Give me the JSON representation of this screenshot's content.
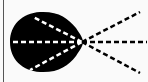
{
  "diagram": {
    "background": "#fafafa",
    "border_color": "#555555",
    "blob": {
      "fill": "#000000",
      "path": "M 40 12 C 58 11, 68 18, 76 28 C 80 34, 83 38, 83 42 C 83 46, 80 50, 76 56 C 68 66, 58 73, 40 72 C 22 71, 10 59, 10 42 C 10 25, 22 13, 40 12 Z"
    },
    "origin": {
      "x": 82,
      "y": 42
    },
    "rays_inside": [
      {
        "x2": 11,
        "y2": 42,
        "color": "#ffffff"
      },
      {
        "x2": 33,
        "y2": 17,
        "color": "#ffffff"
      },
      {
        "x2": 30,
        "y2": 70,
        "color": "#ffffff"
      }
    ],
    "rays_outside": [
      {
        "x2": 147,
        "y2": 42,
        "color": "#000000"
      },
      {
        "x2": 140,
        "y2": 12,
        "color": "#000000"
      },
      {
        "x2": 140,
        "y2": 73,
        "color": "#000000"
      }
    ],
    "dash_pattern": "5 3",
    "stroke_width": 2.5
  }
}
